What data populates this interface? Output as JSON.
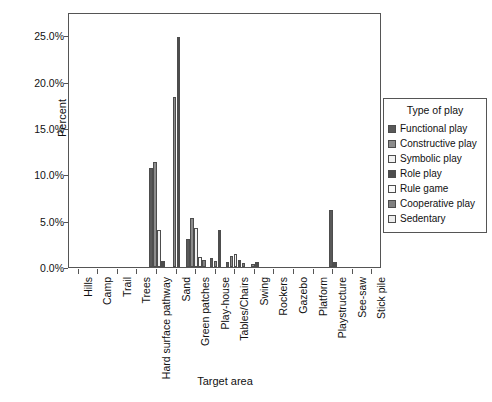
{
  "chart_data": {
    "type": "bar",
    "title": "",
    "xlabel": "Target area",
    "ylabel": "Percent",
    "ylim": [
      0,
      27.5
    ],
    "yticks": [
      "0.0%",
      "5.0%",
      "10.0%",
      "15.0%",
      "20.0%",
      "25.0%"
    ],
    "ytick_values": [
      0,
      5,
      10,
      15,
      20,
      25
    ],
    "grid": false,
    "legend_position": "right",
    "legend_title": "Type of play",
    "categories": [
      "Hills",
      "Camp",
      "Trail",
      "Trees",
      "Hard surface pathway",
      "Sand",
      "Green patches",
      "Play-house",
      "Tables/Chairs",
      "Swing",
      "Rockers",
      "Gazebo",
      "Platform",
      "Playstructure",
      "See-saw",
      "Stick pile"
    ],
    "series": [
      {
        "name": "Functional play",
        "color": "#595959",
        "values": [
          0,
          0,
          0,
          0,
          10.7,
          0,
          3.0,
          1.0,
          0.5,
          0,
          0,
          0,
          0,
          6.1,
          0,
          0
        ]
      },
      {
        "name": "Constructive play",
        "color": "#8c8c8c",
        "values": [
          0,
          0,
          0,
          0,
          11.3,
          18.3,
          5.3,
          0.6,
          1.2,
          0.3,
          0,
          0,
          0,
          0,
          0,
          0
        ]
      },
      {
        "name": "Symbolic play",
        "color": "#f2f2f2",
        "values": [
          0,
          0,
          0,
          0,
          4.0,
          0,
          4.2,
          0,
          1.4,
          0,
          0,
          0,
          0,
          0,
          0,
          0
        ]
      },
      {
        "name": "Role play",
        "color": "#4d4d4d",
        "values": [
          0,
          0,
          0,
          0,
          0.6,
          24.8,
          0,
          4.0,
          0.8,
          0.5,
          0,
          0,
          0,
          0.5,
          0,
          0
        ]
      },
      {
        "name": "Rule game",
        "color": "#fafafa",
        "values": [
          0,
          0,
          0,
          0,
          0,
          0,
          1.1,
          0,
          0,
          0,
          0,
          0,
          0,
          0,
          0,
          0
        ]
      },
      {
        "name": "Cooperative play",
        "color": "#808080",
        "values": [
          0,
          0,
          0,
          0,
          0,
          0,
          0.8,
          0,
          0.4,
          0,
          0,
          0,
          0,
          0,
          0,
          0
        ]
      },
      {
        "name": "Sedentary",
        "color": "#ededed",
        "values": [
          0,
          0,
          0,
          0,
          0,
          0,
          0,
          0,
          0,
          0,
          0,
          0,
          0,
          0,
          0,
          0
        ]
      }
    ]
  },
  "legend": {
    "title": "Type of play",
    "items": [
      {
        "label": "Functional play",
        "color": "#595959"
      },
      {
        "label": "Constructive play",
        "color": "#8c8c8c"
      },
      {
        "label": "Symbolic play",
        "color": "#f2f2f2"
      },
      {
        "label": "Role play",
        "color": "#4d4d4d"
      },
      {
        "label": "Rule game",
        "color": "#fafafa"
      },
      {
        "label": "Cooperative play",
        "color": "#808080"
      },
      {
        "label": "Sedentary",
        "color": "#ededed"
      }
    ]
  }
}
